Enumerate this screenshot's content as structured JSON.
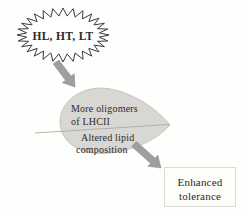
{
  "diagram": {
    "burst": {
      "label": "HL, HT, LT"
    },
    "leaf": {
      "top_line1": "More oligomers",
      "top_line2": "of LHCII",
      "bottom_line1": "Altered lipid",
      "bottom_line2": "composition"
    },
    "outcome": {
      "line1": "Enhanced",
      "line2": "tolerance"
    },
    "colors": {
      "leaf_fill": "#d8d7d3",
      "leaf_stroke": "#b8b6b0",
      "midrib_stroke": "#a6a49e",
      "arrow_fill": "#9e9e9e",
      "arrow_stroke": "#8a8a8a",
      "burst_fill": "#ffffff",
      "burst_stroke": "#3a3a3a",
      "text_dark": "#2e2a25",
      "box_fill": "#fdfdfa",
      "box_border": "#dcdad2"
    }
  }
}
